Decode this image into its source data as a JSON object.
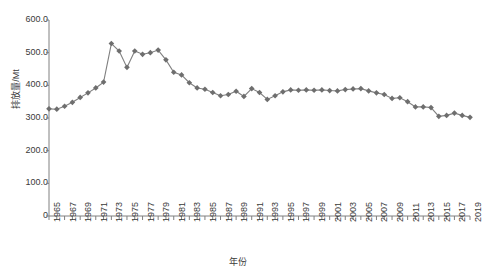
{
  "chart_data": {
    "type": "line",
    "title": "",
    "xlabel": "年份",
    "ylabel": "排放量/Mt",
    "grid": false,
    "legend": "none",
    "xlim": [
      1965,
      2019
    ],
    "ylim": [
      0,
      600
    ],
    "ytick_labels": [
      "600.0",
      "500.0",
      "400.0",
      "300.0",
      "200.0",
      "100.0",
      "0"
    ],
    "ytick_values": [
      600,
      500,
      400,
      300,
      200,
      100,
      0
    ],
    "xtick_labels": [
      "1965",
      "1967",
      "1969",
      "1971",
      "1973",
      "1975",
      "1977",
      "1979",
      "1981",
      "1983",
      "1985",
      "1987",
      "1989",
      "1991",
      "1993",
      "1995",
      "1997",
      "1999",
      "2001",
      "2003",
      "2005",
      "2007",
      "2009",
      "2011",
      "2013",
      "2015",
      "2017",
      "2019"
    ],
    "xtick_step_years": 2,
    "minor_tick_step_years": 1,
    "series_name": "排放量",
    "line_color": "#808080",
    "marker_color": "#6e6e6e",
    "marker": "diamond",
    "x": [
      1965,
      1966,
      1967,
      1968,
      1969,
      1970,
      1971,
      1972,
      1973,
      1974,
      1975,
      1976,
      1977,
      1978,
      1979,
      1980,
      1981,
      1982,
      1983,
      1984,
      1985,
      1986,
      1987,
      1988,
      1989,
      1990,
      1991,
      1992,
      1993,
      1994,
      1995,
      1996,
      1997,
      1998,
      1999,
      2000,
      2001,
      2002,
      2003,
      2004,
      2005,
      2006,
      2007,
      2008,
      2009,
      2010,
      2011,
      2012,
      2013,
      2014,
      2015,
      2016,
      2017,
      2018,
      2019
    ],
    "values": [
      328,
      327,
      336,
      348,
      363,
      377,
      392,
      410,
      528,
      505,
      455,
      505,
      495,
      500,
      508,
      478,
      440,
      432,
      408,
      392,
      388,
      378,
      368,
      372,
      382,
      366,
      390,
      378,
      357,
      368,
      380,
      386,
      385,
      386,
      385,
      386,
      384,
      383,
      387,
      389,
      390,
      383,
      377,
      372,
      360,
      362,
      350,
      334,
      334,
      332,
      305,
      308,
      315,
      308,
      302
    ]
  }
}
